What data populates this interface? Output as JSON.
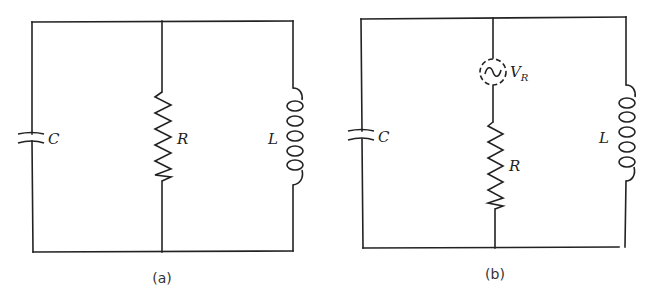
{
  "figure": {
    "panels": [
      {
        "id": "a",
        "caption": "(a)",
        "topology": "parallel",
        "components": {
          "capacitor": {
            "label": "C"
          },
          "resistor": {
            "label": "R"
          },
          "inductor": {
            "label": "L"
          }
        }
      },
      {
        "id": "b",
        "caption": "(b)",
        "topology": "parallel",
        "components": {
          "capacitor": {
            "label": "C"
          },
          "source": {
            "label": "V",
            "subscript": "R",
            "type": "ac-noise-source-dashed"
          },
          "resistor": {
            "label": "R"
          },
          "inductor": {
            "label": "L"
          }
        }
      }
    ]
  }
}
